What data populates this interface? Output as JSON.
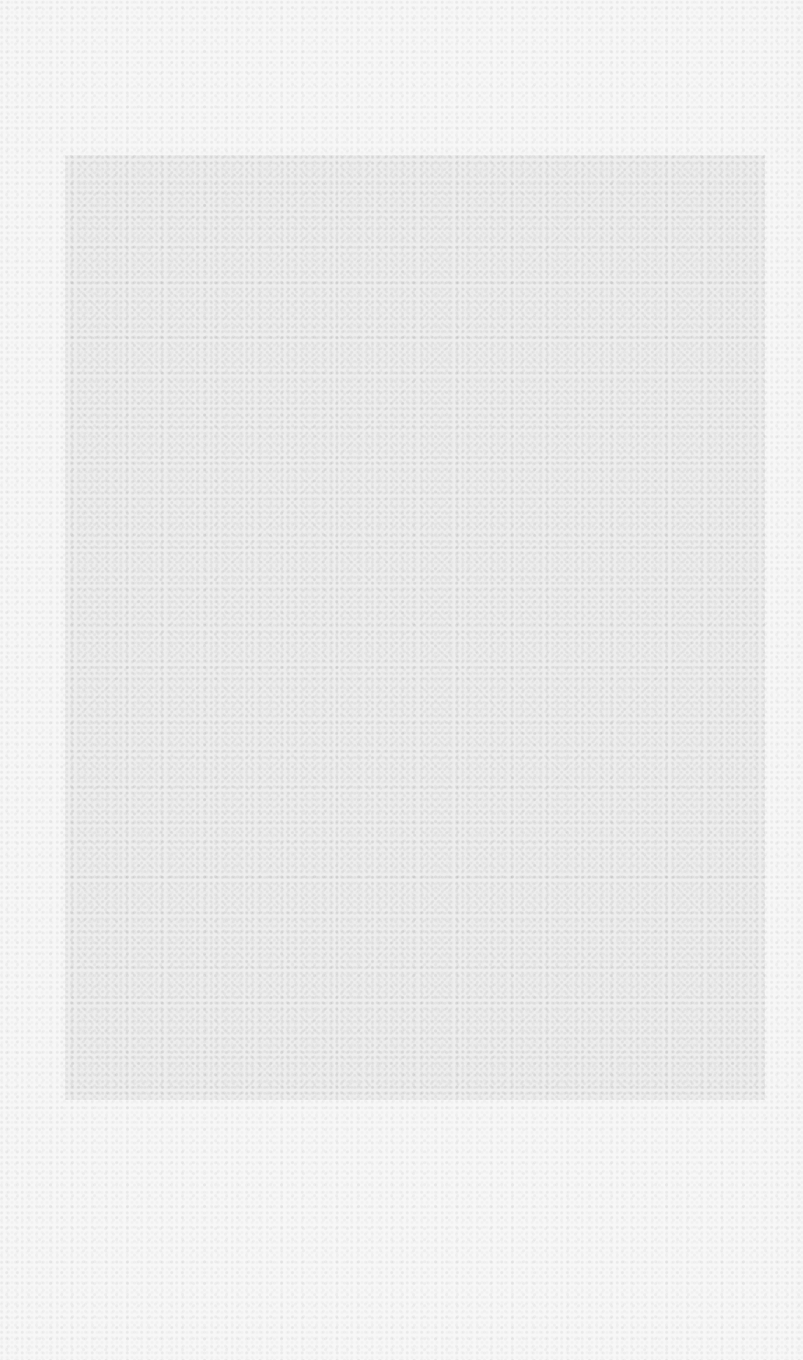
{
  "page": {
    "background_color": "#f7f7f7",
    "panel_color": "#ececec",
    "content": ""
  }
}
